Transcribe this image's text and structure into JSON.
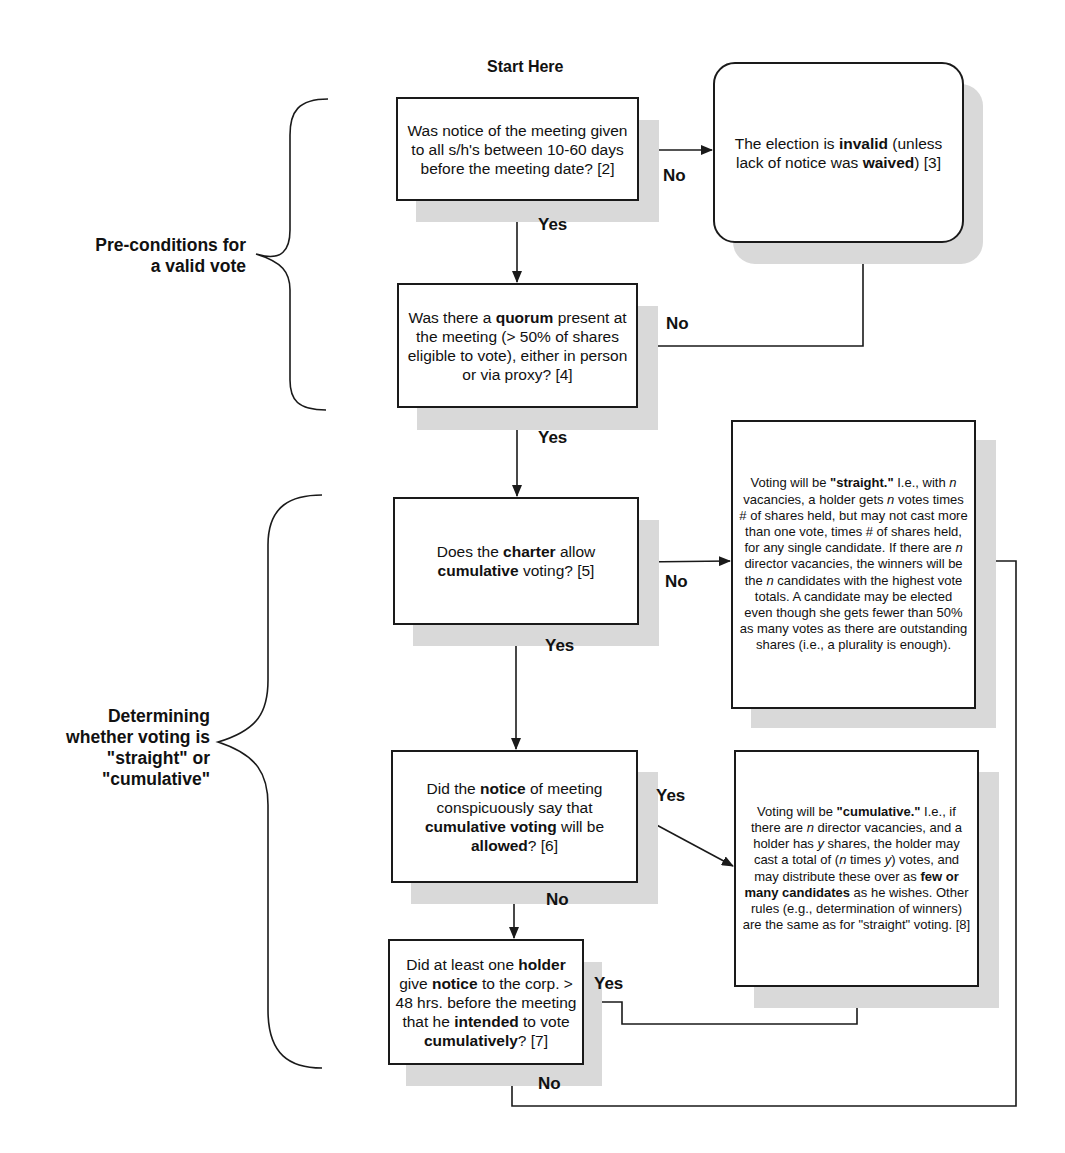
{
  "start_label": "Start Here",
  "sections": [
    {
      "id": "preconditions",
      "label_lines": [
        "Pre-conditions for",
        "a valid vote"
      ]
    },
    {
      "id": "determining",
      "label_lines": [
        "Determining",
        "whether voting is",
        "\"straight\" or",
        "\"cumulative\""
      ]
    }
  ],
  "nodes": {
    "notice": {
      "parts": [
        {
          "t": "Was notice of the meeting given to all s/h's between 10-60 days before the meeting date? [2]"
        }
      ]
    },
    "invalid": {
      "parts": [
        {
          "t": "The election is  "
        },
        {
          "t": "invalid",
          "b": true
        },
        {
          "t": " (unless lack of notice was "
        },
        {
          "t": "waived",
          "b": true
        },
        {
          "t": ") [3]"
        }
      ]
    },
    "quorum": {
      "parts": [
        {
          "t": "Was there a "
        },
        {
          "t": "quorum",
          "b": true
        },
        {
          "t": " present at the meeting (> 50% of shares eligible to vote), either in person or via proxy? [4]"
        }
      ]
    },
    "charter": {
      "parts": [
        {
          "t": "Does the "
        },
        {
          "t": "charter",
          "b": true
        },
        {
          "t": " allow "
        },
        {
          "t": "cumulative",
          "b": true
        },
        {
          "t": " voting? [5]"
        }
      ]
    },
    "straight": {
      "parts": [
        {
          "t": "Voting will be "
        },
        {
          "t": "\"straight.\"",
          "b": true
        },
        {
          "t": " I.e., with "
        },
        {
          "t": "n",
          "i": true
        },
        {
          "t": " vacancies, a holder gets "
        },
        {
          "t": "n",
          "i": true
        },
        {
          "t": " votes times # of shares held, but may not cast more than one vote, times # of shares held, for any single candidate. If there are "
        },
        {
          "t": "n",
          "i": true
        },
        {
          "t": " director vacancies, the winners will be the "
        },
        {
          "t": "n",
          "i": true
        },
        {
          "t": " candidates with the highest vote totals. A candidate may be elected even though she gets fewer than 50% as many votes as there are outstanding shares (i.e., a plurality is enough)."
        }
      ]
    },
    "notice_cumulative": {
      "parts": [
        {
          "t": "Did the "
        },
        {
          "t": "notice",
          "b": true
        },
        {
          "t": " of meeting conspicuously say that "
        },
        {
          "t": "cumulative voting",
          "b": true
        },
        {
          "t": " will be "
        },
        {
          "t": "allowed",
          "b": true
        },
        {
          "t": "? [6]"
        }
      ]
    },
    "cumulative": {
      "parts": [
        {
          "t": "Voting will be "
        },
        {
          "t": "\"cumulative.\"",
          "b": true
        },
        {
          "t": " I.e., if there are "
        },
        {
          "t": "n",
          "i": true
        },
        {
          "t": " director vacancies, and a holder has "
        },
        {
          "t": "y",
          "i": true
        },
        {
          "t": " shares, the holder may cast a total of ("
        },
        {
          "t": "n",
          "i": true
        },
        {
          "t": " times "
        },
        {
          "t": "y",
          "i": true
        },
        {
          "t": ") votes, and may distribute  these over as "
        },
        {
          "t": "few or many candidates",
          "b": true
        },
        {
          "t": " as he wishes. Other rules (e.g., determination of winners) are the same as for \"straight\" voting. [8]"
        }
      ]
    },
    "holder": {
      "parts": [
        {
          "t": "Did at least one "
        },
        {
          "t": "holder",
          "b": true
        },
        {
          "t": " give "
        },
        {
          "t": "notice",
          "b": true
        },
        {
          "t": " to the corp. > 48 hrs. before the meeting that he "
        },
        {
          "t": "intended",
          "b": true
        },
        {
          "t": " to vote "
        },
        {
          "t": "cumulatively",
          "b": true
        },
        {
          "t": "? [7]"
        }
      ]
    }
  },
  "edge_labels": {
    "notice_no": "No",
    "notice_yes": "Yes",
    "quorum_no": "No",
    "quorum_yes": "Yes",
    "charter_no": "No",
    "charter_yes": "Yes",
    "notice_cumulative_yes": "Yes",
    "notice_cumulative_no": "No",
    "holder_yes": "Yes",
    "holder_no": "No"
  },
  "colors": {
    "line": "#1a1a1a",
    "shadow": "#d9d9d9",
    "background": "#ffffff"
  }
}
